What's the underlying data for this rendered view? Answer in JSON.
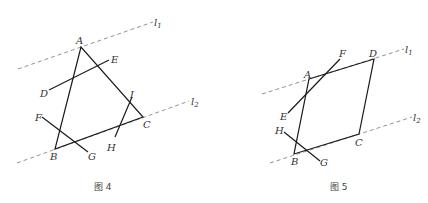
{
  "figures": [
    {
      "caption": "图 4",
      "lines": [
        {
          "name": "l",
          "sub": "1"
        },
        {
          "name": "l",
          "sub": "2"
        }
      ],
      "points": {
        "A": "A",
        "B": "B",
        "C": "C",
        "D": "D",
        "E": "E",
        "F": "F",
        "G": "G",
        "H": "H",
        "I": "I"
      }
    },
    {
      "caption": "图 5",
      "lines": [
        {
          "name": "l",
          "sub": "1"
        },
        {
          "name": "l",
          "sub": "2"
        }
      ],
      "points": {
        "A": "A",
        "B": "B",
        "C": "C",
        "D": "D",
        "E": "E",
        "F": "F",
        "G": "G",
        "H": "H"
      }
    }
  ]
}
